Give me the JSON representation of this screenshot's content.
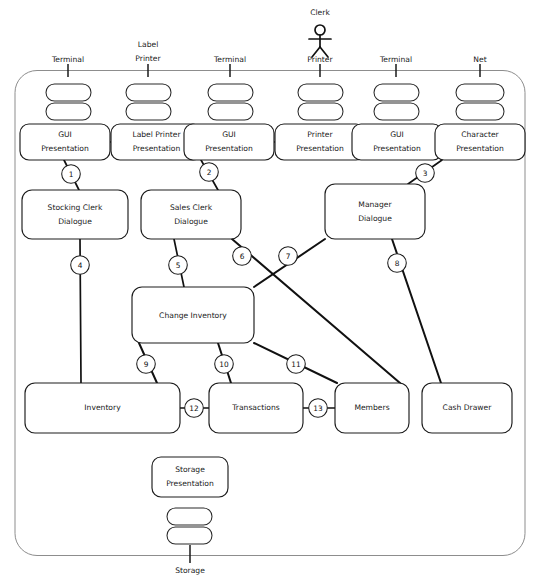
{
  "diagram": {
    "title": "Storage",
    "actor": {
      "label": "Clerk",
      "icon": "stick-figure-actor-icon"
    },
    "external_devices": [
      {
        "id": "dev-terminal-1",
        "label": "Terminal",
        "x": 68,
        "label_y": 60,
        "tick_y": 70
      },
      {
        "id": "dev-label-printer",
        "label": "Label Printer",
        "label_line1": "Label",
        "label_line2": "Printer",
        "x": 148,
        "label_y": 53,
        "tick_y": 70
      },
      {
        "id": "dev-terminal-2",
        "label": "Terminal",
        "x": 230,
        "label_y": 60,
        "tick_y": 70
      },
      {
        "id": "dev-printer",
        "label": "Printer",
        "x": 320,
        "label_y": 60,
        "tick_y": 70
      },
      {
        "id": "dev-terminal-3",
        "label": "Terminal",
        "x": 396,
        "label_y": 60,
        "tick_y": 70
      },
      {
        "id": "dev-net",
        "label": "Net",
        "x": 480,
        "label_y": 60,
        "tick_y": 70
      }
    ],
    "bottom_device": {
      "id": "dev-storage",
      "label": "Storage",
      "x": 190
    },
    "presentation_nodes": [
      {
        "id": "pres-gui-1",
        "line1": "GUI",
        "line2": "Presentation",
        "x": 20,
        "y": 124,
        "w": 90,
        "h": 36
      },
      {
        "id": "pres-label-printer",
        "line1": "Label Printer",
        "line2": "Presentation",
        "x": 111,
        "y": 124,
        "w": 91,
        "h": 36
      },
      {
        "id": "pres-gui-2",
        "line1": "GUI",
        "line2": "Presentation",
        "x": 184,
        "y": 124,
        "w": 90,
        "h": 36
      },
      {
        "id": "pres-printer",
        "line1": "Printer",
        "line2": "Presentation",
        "x": 275,
        "y": 124,
        "w": 90,
        "h": 36
      },
      {
        "id": "pres-gui-3",
        "line1": "GUI",
        "line2": "Presentation",
        "x": 352,
        "y": 124,
        "w": 90,
        "h": 36
      },
      {
        "id": "pres-character",
        "line1": "Character",
        "line2": "Presentation",
        "x": 435,
        "y": 124,
        "w": 90,
        "h": 36
      },
      {
        "id": "pres-storage",
        "line1": "Storage",
        "line2": "Presentation",
        "x": 152,
        "y": 457,
        "w": 76,
        "h": 40
      }
    ],
    "dialogue_nodes": [
      {
        "id": "node-stocking-clerk",
        "line1": "Stocking Clerk",
        "line2": "Dialogue",
        "x": 22,
        "y": 190,
        "w": 106,
        "h": 49
      },
      {
        "id": "node-sales-clerk",
        "line1": "Sales Clerk",
        "line2": "Dialogue",
        "x": 141,
        "y": 190,
        "w": 100,
        "h": 49
      },
      {
        "id": "node-manager",
        "line1": "Manager",
        "line2": "Dialogue",
        "x": 325,
        "y": 184,
        "w": 100,
        "h": 55
      }
    ],
    "process_nodes": [
      {
        "id": "node-change-inventory",
        "label": "Change Inventory",
        "x": 132,
        "y": 287,
        "w": 122,
        "h": 56
      }
    ],
    "store_nodes": [
      {
        "id": "node-inventory",
        "label": "Inventory",
        "x": 25,
        "y": 383,
        "w": 155,
        "h": 50
      },
      {
        "id": "node-transactions",
        "label": "Transactions",
        "x": 207,
        "y": 383,
        "w": 96,
        "h": 50
      },
      {
        "id": "node-members",
        "label": "Members",
        "x": 333,
        "y": 383,
        "w": 74,
        "h": 50
      },
      {
        "id": "node-cash-drawer",
        "label": "Cash Drawer",
        "x": 420,
        "y": 383,
        "w": 90,
        "h": 50
      }
    ],
    "connections": [
      {
        "num": "1",
        "cx": 71,
        "cy": 174,
        "from": [
          64,
          160
        ],
        "to": [
          79,
          190
        ]
      },
      {
        "num": "2",
        "cx": 209,
        "cy": 172,
        "from": [
          201,
          160
        ],
        "to": [
          218,
          190
        ]
      },
      {
        "num": "3",
        "cx": 425,
        "cy": 173,
        "from": [
          442,
          160
        ],
        "to": [
          408,
          184
        ]
      },
      {
        "num": "4",
        "cx": 80,
        "cy": 265,
        "from": [
          80,
          239
        ],
        "to": [
          81,
          383
        ]
      },
      {
        "num": "5",
        "cx": 178,
        "cy": 265,
        "from": [
          174,
          239
        ],
        "to": [
          184,
          287
        ]
      },
      {
        "num": "6",
        "cx": 242,
        "cy": 256,
        "from": [
          232,
          239
        ],
        "to": [
          400,
          383
        ]
      },
      {
        "num": "7",
        "cx": 288,
        "cy": 256,
        "from": [
          325,
          239
        ],
        "to": [
          254,
          287
        ]
      },
      {
        "num": "8",
        "cx": 397,
        "cy": 263,
        "from": [
          392,
          239
        ],
        "to": [
          441,
          383
        ]
      },
      {
        "num": "9",
        "cx": 146,
        "cy": 364,
        "from": [
          139,
          343
        ],
        "to": [
          157,
          383
        ]
      },
      {
        "num": "10",
        "cx": 224,
        "cy": 364,
        "from": [
          218,
          343
        ],
        "to": [
          231,
          383
        ]
      },
      {
        "num": "11",
        "cx": 296,
        "cy": 364,
        "from": [
          254,
          343
        ],
        "to": [
          337,
          383
        ]
      },
      {
        "num": "12",
        "cx": 191,
        "cy": 408,
        "from": [
          180,
          408
        ],
        "to": [
          207,
          408
        ]
      },
      {
        "num": "13",
        "cx": 318,
        "cy": 408,
        "from": [
          303,
          408
        ],
        "to": [
          333,
          408
        ]
      }
    ],
    "presentation_links": [
      {
        "id": "link-gui1-labelprinter",
        "from": [
          110,
          142
        ],
        "to": [
          111,
          142
        ]
      },
      {
        "id": "link-gui2-printer",
        "from": [
          274,
          142
        ],
        "to": [
          275,
          142
        ]
      }
    ]
  }
}
